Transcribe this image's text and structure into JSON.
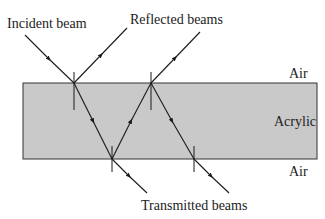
{
  "labels": {
    "incident": "Incident beam",
    "reflected": "Reflected beams",
    "air_top": "Air",
    "acrylic": "Acrylic",
    "air_bottom": "Air",
    "transmitted": "Transmitted beams"
  },
  "colors": {
    "slab_fill": "#c9c9c9",
    "line": "#1a1a1a",
    "background": "#ffffff"
  }
}
